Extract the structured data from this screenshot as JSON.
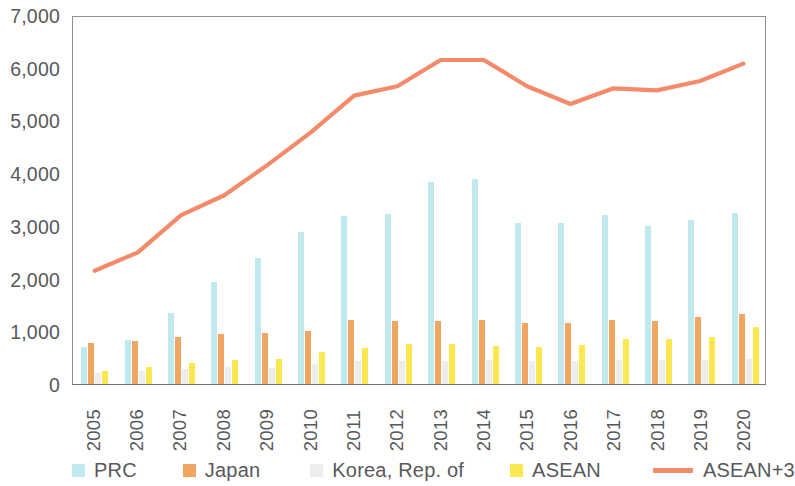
{
  "chart_data": {
    "type": "bar",
    "title": "",
    "subtitle": "",
    "xlabel": "",
    "ylabel": "",
    "ylim": [
      0,
      7000
    ],
    "ytick_step": 1000,
    "ytick_labels": [
      "0",
      "1,000",
      "2,000",
      "3,000",
      "4,000",
      "5,000",
      "6,000",
      "7,000"
    ],
    "ytick_values": [
      0,
      1000,
      2000,
      3000,
      4000,
      5000,
      6000,
      7000
    ],
    "grid": false,
    "legend_position": "bottom",
    "categories": [
      "2005",
      "2006",
      "2007",
      "2008",
      "2009",
      "2010",
      "2011",
      "2012",
      "2013",
      "2014",
      "2015",
      "2016",
      "2017",
      "2018",
      "2019",
      "2020"
    ],
    "series": [
      {
        "name": "PRC",
        "kind": "bar",
        "color": "#bfe9ec",
        "values": [
          700,
          830,
          1350,
          1930,
          2390,
          2880,
          3180,
          3230,
          3830,
          3880,
          3050,
          3060,
          3200,
          3000,
          3120,
          3250
        ]
      },
      {
        "name": "Japan",
        "kind": "bar",
        "color": "#f0a660",
        "values": [
          780,
          820,
          900,
          940,
          960,
          1010,
          1220,
          1200,
          1200,
          1210,
          1160,
          1160,
          1210,
          1200,
          1270,
          1330
        ]
      },
      {
        "name": "Korea, Rep. of",
        "kind": "bar",
        "color": "#ededed",
        "values": [
          200,
          240,
          290,
          330,
          310,
          380,
          430,
          440,
          440,
          460,
          440,
          430,
          450,
          450,
          460,
          480
        ]
      },
      {
        "name": "ASEAN",
        "kind": "bar",
        "color": "#fbe74f",
        "values": [
          250,
          320,
          400,
          450,
          480,
          610,
          680,
          760,
          760,
          720,
          700,
          740,
          860,
          860,
          890,
          1080
        ]
      },
      {
        "name": "ASEAN+3",
        "kind": "line",
        "color": "#f58a6a",
        "values": [
          2160,
          2510,
          3220,
          3600,
          4180,
          4800,
          5500,
          5680,
          6180,
          6180,
          5680,
          5340,
          5640,
          5600,
          5780,
          6110
        ]
      }
    ],
    "legend": [
      {
        "label": "PRC",
        "color": "#bfe9ec",
        "marker": "square"
      },
      {
        "label": "Japan",
        "color": "#f0a660",
        "marker": "square"
      },
      {
        "label": "Korea, Rep. of",
        "color": "#ededed",
        "marker": "square"
      },
      {
        "label": "ASEAN",
        "color": "#fbe74f",
        "marker": "square"
      },
      {
        "label": "ASEAN+3",
        "color": "#f58a6a",
        "marker": "line"
      }
    ]
  }
}
